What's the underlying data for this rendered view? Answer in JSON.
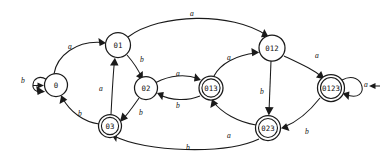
{
  "diagram": {
    "type": "finite-state-automaton",
    "alphabet": [
      "a",
      "b"
    ],
    "start_state": "0",
    "accepting_states": [
      "03",
      "013",
      "023",
      "0123"
    ],
    "colors": {
      "stroke": "#1a1a1a",
      "node_fill": "#ffffff",
      "background": "#ffffff",
      "label": "#111111"
    },
    "nodes": [
      {
        "id": "0",
        "label": "0",
        "cx": 56,
        "cy": 85,
        "r": 11.5,
        "accepting": false,
        "start": true
      },
      {
        "id": "01",
        "label": "01",
        "cx": 118,
        "cy": 45,
        "r": 12.5,
        "accepting": false,
        "start": false
      },
      {
        "id": "02",
        "label": "02",
        "cx": 146,
        "cy": 88,
        "r": 11.5,
        "accepting": false,
        "start": false
      },
      {
        "id": "03",
        "label": "03",
        "cx": 110,
        "cy": 126,
        "r": 11.5,
        "accepting": true,
        "start": false
      },
      {
        "id": "013",
        "label": "013",
        "cx": 211,
        "cy": 88,
        "r": 12.0,
        "accepting": true,
        "start": false
      },
      {
        "id": "012",
        "label": "012",
        "cx": 272,
        "cy": 48,
        "r": 13.0,
        "accepting": false,
        "start": false
      },
      {
        "id": "023",
        "label": "023",
        "cx": 268,
        "cy": 128,
        "r": 12.5,
        "accepting": true,
        "start": false
      },
      {
        "id": "0123",
        "label": "0123",
        "cx": 331,
        "cy": 88,
        "r": 13.5,
        "accepting": true,
        "start": false
      }
    ],
    "edges": [
      {
        "from": "0",
        "to": "0",
        "label": "b",
        "lx": 23,
        "ly": 80
      },
      {
        "from": "0",
        "to": "01",
        "label": "a",
        "lx": 70,
        "ly": 46
      },
      {
        "from": "01",
        "to": "02",
        "label": "b",
        "lx": 142,
        "ly": 59
      },
      {
        "from": "01",
        "to": "012",
        "label": "a",
        "lx": 192,
        "ly": 13
      },
      {
        "from": "02",
        "to": "013",
        "label": "a",
        "lx": 178,
        "ly": 73
      },
      {
        "from": "02",
        "to": "03",
        "label": "b",
        "lx": 141,
        "ly": 112
      },
      {
        "from": "03",
        "to": "0",
        "label": "b",
        "lx": 80,
        "ly": 113
      },
      {
        "from": "03",
        "to": "01",
        "label": "a",
        "lx": 101,
        "ly": 88
      },
      {
        "from": "013",
        "to": "02",
        "label": "b",
        "lx": 178,
        "ly": 105
      },
      {
        "from": "013",
        "to": "012",
        "label": "a",
        "lx": 229,
        "ly": 57
      },
      {
        "from": "012",
        "to": "0123",
        "label": "a",
        "lx": 317,
        "ly": 55
      },
      {
        "from": "012",
        "to": "023",
        "label": "b",
        "lx": 262,
        "ly": 91
      },
      {
        "from": "023",
        "to": "013",
        "label": "a",
        "lx": 229,
        "ly": 135
      },
      {
        "from": "023",
        "to": "03",
        "label": "b",
        "lx": 188,
        "ly": 147
      },
      {
        "from": "0123",
        "to": "0123",
        "label": "a",
        "lx": 366,
        "ly": 84
      },
      {
        "from": "0123",
        "to": "023",
        "label": "b",
        "lx": 307,
        "ly": 131
      }
    ]
  }
}
